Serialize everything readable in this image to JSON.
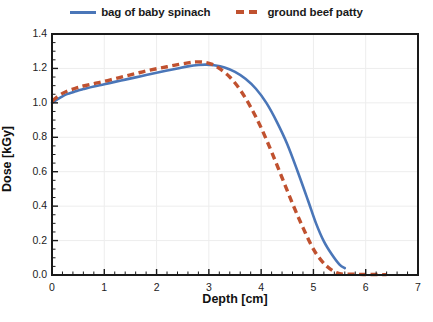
{
  "chart_data": {
    "type": "line",
    "title": "",
    "xlabel": "Depth [cm]",
    "ylabel": "Dose [kGy]",
    "xlim": [
      0,
      7
    ],
    "ylim": [
      0,
      1.4
    ],
    "xticks": [
      "0",
      "1",
      "2",
      "3",
      "4",
      "5",
      "6",
      "7"
    ],
    "yticks": [
      "0.0",
      "0.2",
      "0.4",
      "0.6",
      "0.8",
      "1.0",
      "1.2",
      "1.4"
    ],
    "xtick_values": [
      0,
      1,
      2,
      3,
      4,
      5,
      6,
      7
    ],
    "ytick_values": [
      0.0,
      0.2,
      0.4,
      0.6,
      0.8,
      1.0,
      1.2,
      1.4
    ],
    "x_minor_tick_step": 0.2,
    "y_minor_tick_step": 0.05,
    "grid": true,
    "grid_color": "#EDEDED",
    "legend_position": "top-center",
    "series": [
      {
        "name": "bag of baby spinach",
        "color": "#4A76B8",
        "style": "solid",
        "x": [
          0.0,
          0.1,
          0.2,
          0.3,
          0.4,
          0.5,
          0.6,
          0.8,
          1.0,
          1.2,
          1.4,
          1.6,
          1.8,
          2.0,
          2.2,
          2.4,
          2.6,
          2.8,
          2.95,
          3.1,
          3.3,
          3.5,
          3.7,
          3.9,
          4.1,
          4.3,
          4.5,
          4.7,
          4.9,
          5.05,
          5.2,
          5.35,
          5.5,
          5.6
        ],
        "y": [
          1.0,
          1.02,
          1.038,
          1.052,
          1.062,
          1.072,
          1.08,
          1.095,
          1.108,
          1.122,
          1.135,
          1.148,
          1.162,
          1.175,
          1.188,
          1.2,
          1.212,
          1.22,
          1.222,
          1.218,
          1.205,
          1.18,
          1.14,
          1.082,
          1.0,
          0.89,
          0.76,
          0.6,
          0.43,
          0.3,
          0.195,
          0.12,
          0.06,
          0.04
        ]
      },
      {
        "name": "ground beef patty",
        "color": "#C0512F",
        "style": "dashed",
        "x": [
          0.0,
          0.1,
          0.2,
          0.3,
          0.4,
          0.5,
          0.6,
          0.8,
          1.0,
          1.2,
          1.4,
          1.6,
          1.8,
          2.0,
          2.2,
          2.4,
          2.6,
          2.75,
          2.9,
          3.05,
          3.2,
          3.4,
          3.6,
          3.8,
          4.0,
          4.2,
          4.4,
          4.6,
          4.8,
          5.0,
          5.15,
          5.3,
          5.5,
          5.8,
          6.1,
          6.4
        ],
        "y": [
          1.01,
          1.035,
          1.055,
          1.07,
          1.08,
          1.09,
          1.098,
          1.112,
          1.125,
          1.14,
          1.155,
          1.17,
          1.185,
          1.198,
          1.21,
          1.222,
          1.232,
          1.238,
          1.236,
          1.225,
          1.2,
          1.15,
          1.075,
          0.975,
          0.855,
          0.715,
          0.565,
          0.415,
          0.275,
          0.15,
          0.085,
          0.04,
          0.008,
          0.004,
          0.003,
          0.002
        ]
      }
    ]
  },
  "caption": {
    "text": ""
  }
}
